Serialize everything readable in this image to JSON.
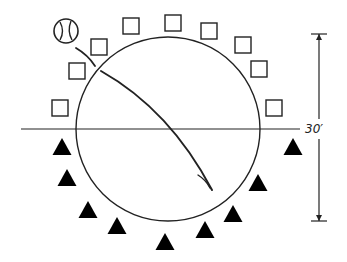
{
  "diagram": {
    "type": "drill-formation",
    "colors": {
      "stroke": "#222222",
      "fill": "#000000",
      "background": "#ffffff"
    },
    "circle": {
      "cx": 168,
      "cy": 129,
      "r": 92
    },
    "center_line": {
      "x1": 21,
      "x2": 300,
      "y": 129
    },
    "dimension": {
      "label": "30′",
      "x": 319,
      "y_top": 34,
      "y_bottom": 221,
      "label_x": 305,
      "label_y": 133
    },
    "ball": {
      "icon": "baseball-icon",
      "cx": 66,
      "cy": 31,
      "r": 12
    },
    "ball_path_short": "M 76 48 Q 88 55 95 66",
    "ball_path_long": "M 101 71 Q 170 110 212 190",
    "ball_path_end": "M 198 175 Q 206 180 210 188",
    "squares_legend": "square players (offense)",
    "squares": [
      {
        "x": 52,
        "y": 100
      },
      {
        "x": 69,
        "y": 63
      },
      {
        "x": 91,
        "y": 39
      },
      {
        "x": 123,
        "y": 18
      },
      {
        "x": 165,
        "y": 15
      },
      {
        "x": 201,
        "y": 23
      },
      {
        "x": 235,
        "y": 37
      },
      {
        "x": 251,
        "y": 61
      },
      {
        "x": 266,
        "y": 100
      }
    ],
    "square_size": 16,
    "triangles_legend": "triangle players (defense)",
    "triangles": [
      {
        "cx": 62,
        "top": 138
      },
      {
        "cx": 67,
        "top": 169
      },
      {
        "cx": 88,
        "top": 201
      },
      {
        "cx": 117,
        "top": 217
      },
      {
        "cx": 165,
        "top": 233
      },
      {
        "cx": 205,
        "top": 221
      },
      {
        "cx": 233,
        "top": 205
      },
      {
        "cx": 258,
        "top": 174
      },
      {
        "cx": 293,
        "top": 138
      }
    ],
    "triangle_width": 19,
    "triangle_height": 17
  }
}
